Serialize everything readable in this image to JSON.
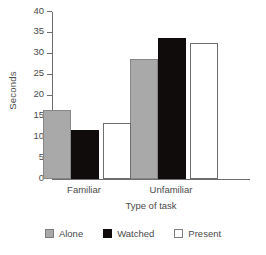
{
  "chart_data": {
    "type": "bar",
    "title": "",
    "xlabel": "Type of task",
    "ylabel": "Seconds",
    "categories": [
      "Familiar",
      "Unfamiliar"
    ],
    "series": [
      {
        "name": "Alone",
        "color": "#a9a9a9",
        "values": [
          16.5,
          28.7
        ]
      },
      {
        "name": "Watched",
        "color": "#100c0c",
        "values": [
          11.8,
          33.7
        ]
      },
      {
        "name": "Present",
        "color": "#ffffff",
        "values": [
          13.3,
          32.5
        ]
      }
    ],
    "ylim": [
      0,
      40
    ],
    "ytick_labels": [
      "0",
      "5",
      "10",
      "15",
      "20",
      "25",
      "30",
      "35",
      "40"
    ],
    "ytick_values": [
      0,
      5,
      10,
      15,
      20,
      25,
      30,
      35,
      40
    ],
    "grid": false,
    "legend_position": "bottom"
  }
}
